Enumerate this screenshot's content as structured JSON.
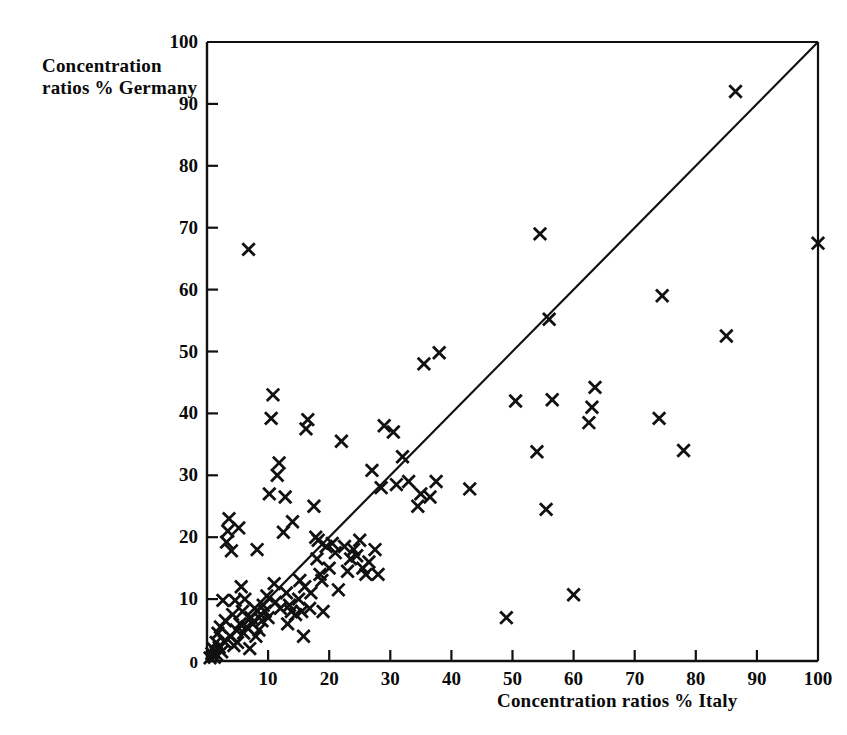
{
  "chart_data": {
    "type": "scatter",
    "title": "",
    "xlabel": "Concentration ratios % Italy",
    "ylabel": "Concentration ratios % Germany",
    "xlim": [
      0,
      100
    ],
    "ylim": [
      0,
      100
    ],
    "xticks": [
      0,
      10,
      20,
      30,
      40,
      50,
      60,
      70,
      80,
      90,
      100
    ],
    "yticks": [
      0,
      10,
      20,
      30,
      40,
      50,
      60,
      70,
      80,
      90,
      100
    ],
    "xtick_labels": [
      "0",
      "10",
      "20",
      "30",
      "40",
      "50",
      "60",
      "70",
      "80",
      "90",
      "100"
    ],
    "ytick_labels": [
      "0",
      "10",
      "20",
      "30",
      "40",
      "50",
      "60",
      "70",
      "80",
      "90",
      "100"
    ],
    "grid": false,
    "legend": null,
    "marker": "x",
    "marker_color": "#111111",
    "reference_line": {
      "name": "45-degree-line",
      "from": [
        0,
        0
      ],
      "to": [
        100,
        100
      ],
      "color": "#111111"
    },
    "points": [
      [
        0.5,
        0.5
      ],
      [
        0.8,
        1.2
      ],
      [
        1.0,
        2.0
      ],
      [
        1.2,
        0.6
      ],
      [
        1.5,
        3.0
      ],
      [
        1.6,
        1.0
      ],
      [
        1.8,
        4.5
      ],
      [
        2.0,
        2.2
      ],
      [
        2.2,
        5.5
      ],
      [
        2.4,
        1.5
      ],
      [
        2.6,
        9.8
      ],
      [
        2.8,
        3.2
      ],
      [
        3.0,
        6.5
      ],
      [
        3.2,
        19.2
      ],
      [
        3.4,
        21.0
      ],
      [
        3.6,
        23.0
      ],
      [
        3.8,
        4.0
      ],
      [
        4.0,
        17.8
      ],
      [
        4.2,
        7.5
      ],
      [
        4.4,
        2.5
      ],
      [
        4.6,
        9.8
      ],
      [
        4.8,
        5.0
      ],
      [
        5.0,
        3.0
      ],
      [
        5.2,
        21.5
      ],
      [
        5.4,
        6.0
      ],
      [
        5.6,
        12.0
      ],
      [
        5.8,
        8.0
      ],
      [
        6.0,
        4.5
      ],
      [
        6.2,
        10.0
      ],
      [
        6.5,
        5.5
      ],
      [
        6.8,
        66.5
      ],
      [
        7.0,
        2.0
      ],
      [
        7.2,
        7.0
      ],
      [
        7.5,
        6.0
      ],
      [
        7.8,
        8.5
      ],
      [
        8.0,
        4.0
      ],
      [
        8.2,
        18.0
      ],
      [
        8.5,
        5.0
      ],
      [
        8.8,
        7.5
      ],
      [
        9.0,
        6.5
      ],
      [
        9.2,
        9.0
      ],
      [
        9.5,
        8.0
      ],
      [
        9.8,
        10.5
      ],
      [
        10.0,
        7.0
      ],
      [
        10.2,
        27.0
      ],
      [
        10.5,
        39.2
      ],
      [
        10.8,
        43.0
      ],
      [
        11.0,
        12.5
      ],
      [
        11.2,
        9.5
      ],
      [
        11.5,
        30.0
      ],
      [
        11.8,
        32.0
      ],
      [
        12.0,
        8.5
      ],
      [
        12.5,
        20.8
      ],
      [
        12.8,
        26.5
      ],
      [
        13.0,
        11.0
      ],
      [
        13.2,
        6.0
      ],
      [
        13.5,
        9.0
      ],
      [
        13.8,
        8.0
      ],
      [
        14.0,
        22.5
      ],
      [
        14.5,
        7.5
      ],
      [
        15.0,
        10.0
      ],
      [
        15.2,
        13.0
      ],
      [
        15.5,
        8.0
      ],
      [
        15.8,
        4.0
      ],
      [
        16.0,
        12.0
      ],
      [
        16.2,
        37.5
      ],
      [
        16.5,
        39.0
      ],
      [
        16.8,
        8.5
      ],
      [
        17.0,
        11.0
      ],
      [
        17.5,
        25.0
      ],
      [
        17.8,
        20.0
      ],
      [
        18.0,
        16.5
      ],
      [
        18.2,
        19.5
      ],
      [
        18.5,
        14.0
      ],
      [
        18.8,
        13.0
      ],
      [
        19.0,
        8.0
      ],
      [
        19.5,
        18.5
      ],
      [
        20.0,
        15.0
      ],
      [
        20.5,
        19.0
      ],
      [
        21.0,
        17.5
      ],
      [
        21.5,
        11.5
      ],
      [
        22.0,
        35.5
      ],
      [
        22.5,
        18.5
      ],
      [
        23.0,
        14.5
      ],
      [
        23.5,
        16.5
      ],
      [
        24.0,
        18.0
      ],
      [
        24.5,
        17.0
      ],
      [
        25.0,
        19.5
      ],
      [
        25.5,
        15.0
      ],
      [
        26.0,
        14.0
      ],
      [
        26.5,
        16.0
      ],
      [
        27.0,
        30.8
      ],
      [
        27.5,
        18.0
      ],
      [
        28.0,
        14.0
      ],
      [
        28.5,
        28.0
      ],
      [
        29.0,
        38.0
      ],
      [
        30.5,
        37.0
      ],
      [
        31.0,
        28.5
      ],
      [
        32.0,
        33.0
      ],
      [
        33.0,
        29.0
      ],
      [
        34.5,
        25.0
      ],
      [
        35.0,
        27.0
      ],
      [
        35.5,
        48.0
      ],
      [
        36.5,
        26.5
      ],
      [
        37.5,
        29.0
      ],
      [
        38.0,
        49.8
      ],
      [
        43.0,
        27.8
      ],
      [
        49.0,
        7.0
      ],
      [
        50.5,
        42.0
      ],
      [
        54.0,
        33.8
      ],
      [
        54.5,
        69.0
      ],
      [
        55.5,
        24.5
      ],
      [
        56.0,
        55.2
      ],
      [
        56.5,
        42.2
      ],
      [
        60.0,
        10.7
      ],
      [
        62.5,
        38.5
      ],
      [
        63.0,
        41.0
      ],
      [
        63.5,
        44.2
      ],
      [
        74.0,
        39.2
      ],
      [
        74.5,
        59.0
      ],
      [
        78.0,
        34.0
      ],
      [
        85.0,
        52.5
      ],
      [
        86.5,
        92.0
      ],
      [
        100.0,
        67.5
      ]
    ]
  },
  "axes": {
    "y_title_line1": "Concentration",
    "y_title_line2": "ratios % Germany",
    "x_title": "Concentration ratios % Italy"
  }
}
